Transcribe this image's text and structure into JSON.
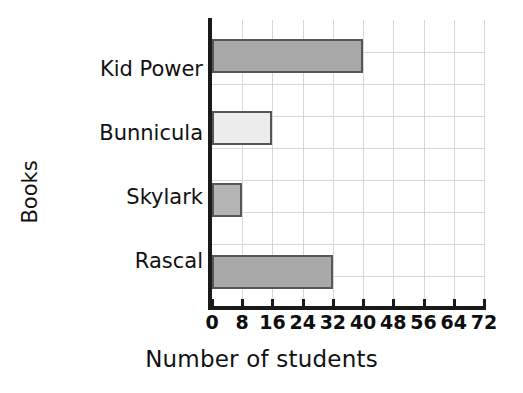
{
  "chart_data": {
    "type": "bar",
    "orientation": "horizontal",
    "title": "",
    "categories": [
      "Kid Power",
      "Bunnicula",
      "Skylark",
      "Rascal"
    ],
    "values": [
      40,
      16,
      8,
      32
    ],
    "xlabel": "Number of students",
    "ylabel": "Books",
    "xlim": [
      0,
      72
    ],
    "xticks": [
      "0",
      "8",
      "16",
      "24",
      "32",
      "40",
      "48",
      "56",
      "64",
      "72"
    ],
    "xtick_values": [
      0,
      8,
      16,
      24,
      32,
      40,
      48,
      56,
      64,
      72
    ],
    "grid": true,
    "legend": "none",
    "bar_colors": [
      "#a9a9a9",
      "#ececec",
      "#b4b4b4",
      "#a9a9a9"
    ],
    "bar_border_color": "#565656",
    "grid_color": "#d7d7d7",
    "axis_color": "#1a1a1a",
    "annotations": []
  },
  "figure": {
    "cropped_title_remnant": "Books Read"
  }
}
